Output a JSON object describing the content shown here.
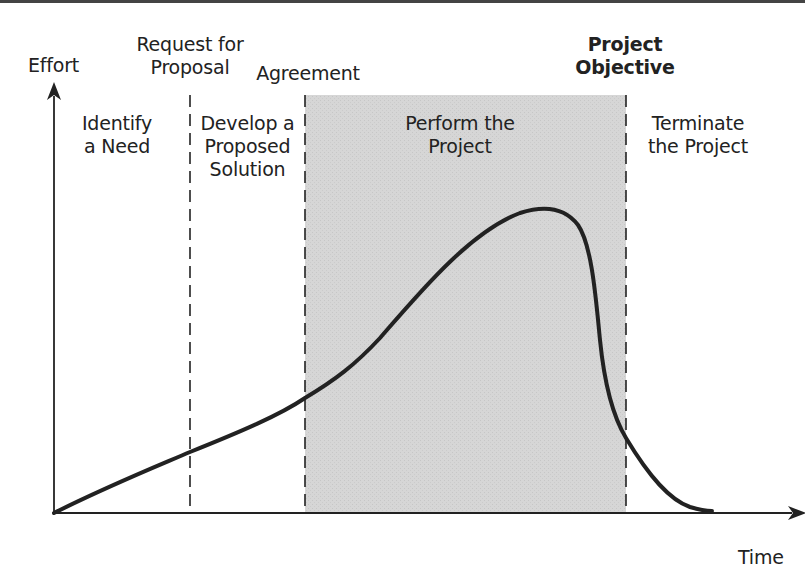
{
  "diagram": {
    "type": "project-life-cycle",
    "axes": {
      "y_label": "Effort",
      "x_label": "Time"
    },
    "milestones": [
      {
        "id": "rfp",
        "line1": "Request for",
        "line2": "Proposal"
      },
      {
        "id": "agreement",
        "line1": "Agreement"
      },
      {
        "id": "objective",
        "line1": "Project",
        "line2": "Objective"
      }
    ],
    "phases": [
      {
        "id": "identify",
        "line1": "Identify",
        "line2": "a Need"
      },
      {
        "id": "develop",
        "line1": "Develop a",
        "line2": "Proposed",
        "line3": "Solution"
      },
      {
        "id": "perform",
        "line1": "Perform the",
        "line2": "Project",
        "highlighted": true
      },
      {
        "id": "terminate",
        "line1": "Terminate",
        "line2": "the Project"
      }
    ],
    "colors": {
      "line": "#222222",
      "shade": "#d4d4d4",
      "background": "#ffffff"
    }
  }
}
